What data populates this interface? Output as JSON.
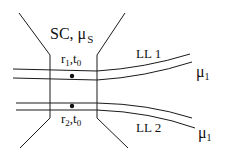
{
  "diagram": {
    "superconductor_label": "SC, μ",
    "superconductor_sub": "S",
    "point1": {
      "r": "r",
      "r_sub": "1",
      "t": "t",
      "t_sub": "0"
    },
    "point2": {
      "r": "r",
      "r_sub": "2",
      "t": "t",
      "t_sub": "0"
    },
    "lead1": {
      "label": "LL 1",
      "mu": "μ",
      "mu_sub": "1"
    },
    "lead2": {
      "label": "LL 2",
      "mu": "μ",
      "mu_sub": "1"
    },
    "colors": {
      "line": "#1a1a1a",
      "background": "#ffffff"
    }
  }
}
